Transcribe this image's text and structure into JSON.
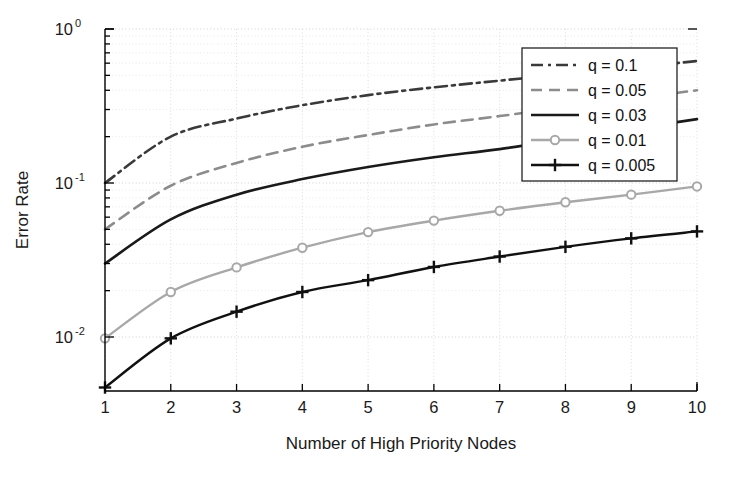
{
  "chart_data": {
    "type": "line",
    "title": "",
    "xlabel": "Number of High Priority Nodes",
    "ylabel": "Error Rate",
    "x": [
      1,
      2,
      3,
      4,
      5,
      6,
      7,
      8,
      9,
      10
    ],
    "xlim": [
      1,
      10
    ],
    "ylim": [
      0.0045,
      1
    ],
    "yscale": "log",
    "xscale": "linear",
    "grid": true,
    "grid_style": "dotted",
    "legend_position": "upper right",
    "xticks": [
      "1",
      "2",
      "3",
      "4",
      "5",
      "6",
      "7",
      "8",
      "9",
      "10"
    ],
    "yticks": [
      "10^0",
      "10^-1",
      "10^-2"
    ],
    "ytick_labels": [
      {
        "base": "10",
        "exp": "0"
      },
      {
        "base": "10",
        "exp": "-1"
      },
      {
        "base": "10",
        "exp": "-2"
      }
    ],
    "series": [
      {
        "name": "q = 0.1",
        "q": 0.1,
        "style": "dash-dot",
        "color": "#3a3a3a",
        "marker": "none",
        "values": [
          0.1,
          0.2,
          0.262,
          0.32,
          0.372,
          0.418,
          0.462,
          0.51,
          0.56,
          0.62
        ]
      },
      {
        "name": "q = 0.05",
        "q": 0.05,
        "style": "dashed",
        "color": "#8c8c8c",
        "marker": "none",
        "values": [
          0.05,
          0.096,
          0.135,
          0.172,
          0.205,
          0.24,
          0.272,
          0.31,
          0.352,
          0.4
        ]
      },
      {
        "name": "q = 0.03",
        "q": 0.03,
        "style": "solid",
        "color": "#1a1a1a",
        "marker": "none",
        "values": [
          0.03,
          0.058,
          0.084,
          0.106,
          0.127,
          0.147,
          0.166,
          0.193,
          0.224,
          0.26
        ]
      },
      {
        "name": "q = 0.01",
        "q": 0.01,
        "style": "solid",
        "color": "#a8a8a8",
        "marker": "circle",
        "values": [
          0.0098,
          0.0196,
          0.0283,
          0.038,
          0.048,
          0.057,
          0.066,
          0.075,
          0.084,
          0.095
        ]
      },
      {
        "name": "q = 0.005",
        "q": 0.005,
        "style": "solid",
        "color": "#111111",
        "marker": "plus",
        "values": [
          0.0047,
          0.0098,
          0.0146,
          0.0196,
          0.0234,
          0.0285,
          0.0333,
          0.0385,
          0.0437,
          0.0485
        ]
      }
    ]
  },
  "legend": {
    "items": [
      {
        "label": "q = 0.1"
      },
      {
        "label": "q = 0.05"
      },
      {
        "label": "q = 0.03"
      },
      {
        "label": "q = 0.01"
      },
      {
        "label": "q = 0.005"
      }
    ]
  },
  "axes": {
    "x_title": "Number of High Priority Nodes",
    "y_title": "Error Rate"
  }
}
